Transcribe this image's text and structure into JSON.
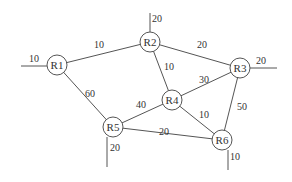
{
  "diagram": {
    "title": "",
    "node_radius": 10,
    "nodes": [
      {
        "id": "R1",
        "label": "R1",
        "x": 57,
        "y": 65
      },
      {
        "id": "R2",
        "label": "R2",
        "x": 150,
        "y": 42
      },
      {
        "id": "R3",
        "label": "R3",
        "x": 240,
        "y": 68
      },
      {
        "id": "R4",
        "label": "R4",
        "x": 172,
        "y": 100
      },
      {
        "id": "R5",
        "label": "R5",
        "x": 113,
        "y": 127
      },
      {
        "id": "R6",
        "label": "R6",
        "x": 222,
        "y": 140
      }
    ],
    "edges": [
      {
        "from": "R1",
        "to": "R2",
        "weight": "10",
        "lx": 94,
        "ly": 48
      },
      {
        "from": "R1",
        "to": "R5",
        "weight": "60",
        "lx": 85,
        "ly": 97
      },
      {
        "from": "R2",
        "to": "R3",
        "weight": "20",
        "lx": 197,
        "ly": 48
      },
      {
        "from": "R2",
        "to": "R4",
        "weight": "10",
        "lx": 164,
        "ly": 70
      },
      {
        "from": "R3",
        "to": "R4",
        "weight": "30",
        "lx": 199,
        "ly": 83
      },
      {
        "from": "R4",
        "to": "R5",
        "weight": "40",
        "lx": 136,
        "ly": 108
      },
      {
        "from": "R4",
        "to": "R6",
        "weight": "10",
        "lx": 199,
        "ly": 118
      },
      {
        "from": "R3",
        "to": "R6",
        "weight": "50",
        "lx": 237,
        "ly": 110
      },
      {
        "from": "R5",
        "to": "R6",
        "weight": "20",
        "lx": 159,
        "ly": 135
      }
    ],
    "stubs": [
      {
        "node": "R1",
        "weight": "10",
        "x1": 21,
        "y1": 66,
        "x2": 47,
        "y2": 66,
        "lx": 29,
        "ly": 62
      },
      {
        "node": "R2",
        "weight": "20",
        "x1": 150,
        "y1": 13,
        "x2": 150,
        "y2": 32,
        "lx": 152,
        "ly": 22
      },
      {
        "node": "R3",
        "weight": "20",
        "x1": 250,
        "y1": 68,
        "x2": 277,
        "y2": 68,
        "lx": 256,
        "ly": 64
      },
      {
        "node": "R5",
        "weight": "20",
        "x1": 107,
        "y1": 137,
        "x2": 107,
        "y2": 167,
        "lx": 110,
        "ly": 151
      },
      {
        "node": "R6",
        "weight": "10",
        "x1": 228,
        "y1": 150,
        "x2": 228,
        "y2": 170,
        "lx": 230,
        "ly": 160
      }
    ]
  }
}
